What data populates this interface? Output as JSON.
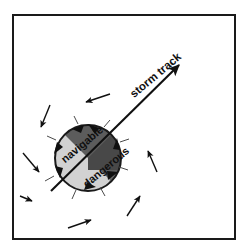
{
  "figure": {
    "frame": {
      "border_color": "#1a1a1a",
      "background_color": "#ffffff",
      "border_width": 2,
      "x": 13,
      "y": 15,
      "width": 222,
      "height": 224
    },
    "labels": [
      {
        "id": "storm-track",
        "text": "storm track",
        "x": 182,
        "y": 58,
        "rotation": -40,
        "font_size": 11.5,
        "color": "#101010"
      },
      {
        "id": "navigable",
        "text": "navigable",
        "x": 104,
        "y": 131,
        "rotation": -40,
        "font_size": 11,
        "color": "#101010"
      },
      {
        "id": "dangerous",
        "text": "dangerous",
        "x": 130,
        "y": 152,
        "rotation": -40,
        "font_size": 11,
        "color": "#101010"
      }
    ],
    "storm_track": {
      "id": "storm-track-arrow",
      "start_x": 51,
      "start_y": 191,
      "end_x": 179,
      "end_y": 65,
      "color": "#101010",
      "line_width": 2.1,
      "arrowhead": "solid-triangle",
      "direction": "up-right",
      "bearing_degrees": 45
    },
    "storm_center": {
      "id": "storm-circle",
      "cx": 88,
      "cy": 158,
      "r": 33,
      "outline_color": "#1a1a1a",
      "outline_width": 2,
      "rotation_sense": "counterclockwise",
      "hemisphere": "northern",
      "sectors": [
        {
          "id": "navigable-semicircle",
          "label_ref": "navigable",
          "fill": "#d2d2d2",
          "side": "upper-left"
        },
        {
          "id": "dangerous-semicircle-upper",
          "label_ref": "dangerous",
          "fill": "#484848",
          "side": "right-wedge"
        },
        {
          "id": "dangerous-semicircle-lower",
          "label_ref": "dangerous",
          "fill": "#5c5c5c",
          "side": "lower-wedge"
        }
      ]
    },
    "rim_arrows": {
      "id": "circulation-arrows",
      "count": 6,
      "color": "#101010",
      "description": "counterclockwise curved arrowheads around the storm circle rim"
    },
    "wind_arrows": {
      "id": "wind-field-arrows",
      "color": "#101010",
      "count": 7,
      "description": "straight wind-field arrows circling the storm counterclockwise",
      "items": [
        {
          "id": "wind-arrow-top",
          "x1": 110,
          "y1": 94,
          "x2": 86,
          "y2": 102
        },
        {
          "id": "wind-arrow-upper-left",
          "x1": 50,
          "y1": 105,
          "x2": 41,
          "y2": 127
        },
        {
          "id": "wind-arrow-left",
          "x1": 23,
          "y1": 153,
          "x2": 39,
          "y2": 172
        },
        {
          "id": "wind-arrow-lower-left",
          "x1": 20,
          "y1": 196,
          "x2": 31,
          "y2": 200
        },
        {
          "id": "wind-arrow-bottom",
          "x1": 68,
          "y1": 228,
          "x2": 91,
          "y2": 220
        },
        {
          "id": "wind-arrow-lower-right",
          "x1": 127,
          "y1": 216,
          "x2": 140,
          "y2": 196
        },
        {
          "id": "wind-arrow-right",
          "x1": 157,
          "y1": 172,
          "x2": 148,
          "y2": 151
        }
      ]
    }
  }
}
